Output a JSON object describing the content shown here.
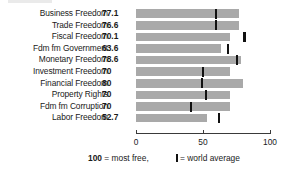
{
  "chart_data": {
    "type": "bar",
    "orientation": "horizontal",
    "title": "",
    "xlabel": "",
    "ylabel": "",
    "xlim": [
      0,
      100
    ],
    "xticks": [
      0,
      50,
      100
    ],
    "xtick_labels": [
      "0",
      "50",
      "100"
    ],
    "grid": false,
    "legend_position": "bottom",
    "categories": [
      "Business Freedom",
      "Trade Freedom",
      "Fiscal Freedom",
      "Fdm fm Government",
      "Monetary Freedom",
      "Investment Freedom",
      "Financial Freedom",
      "Property Rights",
      "Fdm fm Corruption",
      "Labor Freedom"
    ],
    "values": [
      77.1,
      76.6,
      70.1,
      63.6,
      78.6,
      70,
      80,
      70,
      70,
      52.7
    ],
    "value_labels": [
      "77.1",
      "76.6",
      "70.1",
      "63.6",
      "78.6",
      "70",
      "80",
      "70",
      "70",
      "52.7"
    ],
    "series": [
      {
        "name": "Score",
        "values": [
          77.1,
          76.6,
          70.1,
          63.6,
          78.6,
          70,
          80,
          70,
          70,
          52.7
        ]
      },
      {
        "name": "world average",
        "marker": "vertical-line",
        "values": [
          60.0,
          60.0,
          81.0,
          68.5,
          75.5,
          50.0,
          49.0,
          52.5,
          41.0,
          62.0
        ]
      }
    ],
    "bar_color": "#a9a9a9",
    "marker_color": "#111111"
  },
  "legend": {
    "most_free_value": "100",
    "most_free_text": " = most free,",
    "world_average_text": "= world average"
  }
}
